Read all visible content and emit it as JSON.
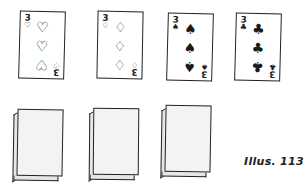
{
  "illustration": {
    "caption": "Illus. 113",
    "face_up_cards": [
      {
        "rank": "3",
        "suit": "hearts",
        "suit_symbol": "♡",
        "pip": "♡",
        "color": "#222222"
      },
      {
        "rank": "3",
        "suit": "diamonds",
        "suit_symbol": "♢",
        "pip": "♢",
        "color": "#222222"
      },
      {
        "rank": "3",
        "suit": "spades",
        "suit_symbol": "♠",
        "pip": "♠",
        "color": "#111111"
      },
      {
        "rank": "3",
        "suit": "clubs",
        "suit_symbol": "♣",
        "pip": "♣",
        "color": "#111111"
      }
    ],
    "face_down_stacks": [
      {
        "label": "stack-1"
      },
      {
        "label": "stack-2"
      },
      {
        "label": "stack-3"
      }
    ]
  }
}
